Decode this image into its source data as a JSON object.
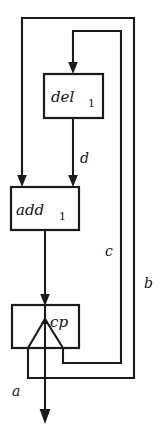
{
  "diagram": {
    "type": "dataflow-graph",
    "background_color": "#ffffff",
    "line_color": "#1a1a1a",
    "nodes": [
      {
        "id": "del1",
        "name": "delay-node",
        "label": "del",
        "subscript": "1",
        "x": 44,
        "y": 74,
        "width": 59,
        "height": 44
      },
      {
        "id": "add1",
        "name": "adder-node",
        "label": "add",
        "subscript": "1",
        "x": 11,
        "y": 187,
        "width": 68,
        "height": 43
      },
      {
        "id": "cp",
        "name": "copy-node",
        "label": "cp",
        "subscript": "",
        "x": 12,
        "y": 305,
        "width": 67,
        "height": 43
      }
    ],
    "edge_labels": [
      {
        "id": "d",
        "name": "edge-label-d",
        "text": "d",
        "x": 80,
        "y": 163
      },
      {
        "id": "c",
        "name": "edge-label-c",
        "text": "c",
        "x": 108,
        "y": 251
      },
      {
        "id": "b",
        "name": "edge-label-b",
        "text": "b",
        "x": 146,
        "y": 283
      },
      {
        "id": "a",
        "name": "edge-label-a",
        "text": "a",
        "x": 12,
        "y": 392
      }
    ],
    "edges": [
      {
        "id": "b-feedback",
        "from": "cp",
        "to": "add1",
        "label": "b"
      },
      {
        "id": "c-feedback",
        "from": "cp",
        "to": "del1",
        "label": "c"
      },
      {
        "id": "d-forward",
        "from": "del1",
        "to": "add1",
        "label": "d"
      },
      {
        "id": "add-to-cp",
        "from": "add1",
        "to": "cp",
        "label": ""
      },
      {
        "id": "a-output",
        "from": "cp",
        "to": "output",
        "label": "a"
      }
    ]
  }
}
